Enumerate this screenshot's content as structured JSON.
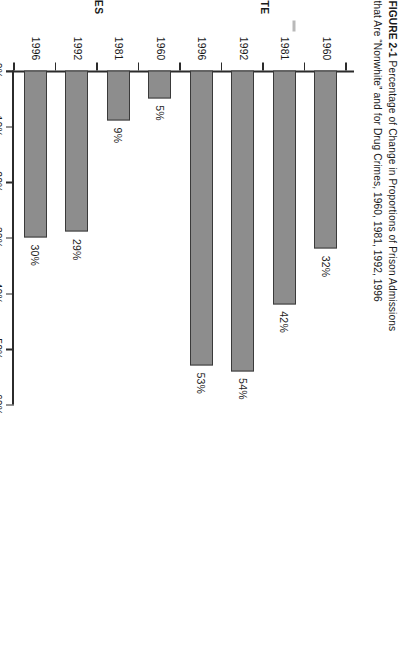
{
  "figure": {
    "number": "FIGURE 2-1",
    "caption_line1": "Percentage of Change in Proportions of Prison Admissions",
    "caption_line2": "that Are “Nonwhite” and for Drug Crimes, 1960, 1981, 1992, 1996"
  },
  "colors": {
    "bar_fill": "#8d8d8d",
    "bar_stroke": "#3a3a3a",
    "axis": "#2b2b2b",
    "text": "#1a1a1a",
    "group_dash": "#b9b9b9"
  },
  "chart_data": {
    "type": "bar",
    "title": "Percentage of Change in Proportions of Prison Admissions that Are “Nonwhite” and for Drug Crimes, 1960, 1981, 1992, 1996",
    "orientation": "horizontal-bar-rotated-page",
    "xlabel": "",
    "ylabel": "",
    "ylim": [
      0,
      60
    ],
    "yticks": [
      0,
      10,
      20,
      30,
      40,
      50,
      60
    ],
    "ytick_labels": [
      "0%",
      "10%",
      "20%",
      "30%",
      "40%",
      "50%",
      "60%"
    ],
    "grid": false,
    "legend": false,
    "groups": [
      {
        "name": "NONWHITE",
        "categories": [
          "1960",
          "1981",
          "1992",
          "1996"
        ],
        "values": [
          32,
          42,
          54,
          53
        ],
        "value_labels": [
          "32%",
          "42%",
          "54%",
          "53%"
        ]
      },
      {
        "name": "DRUG CRIMES",
        "categories": [
          "1960",
          "1981",
          "1992",
          "1996"
        ],
        "values": [
          5,
          9,
          29,
          30
        ],
        "value_labels": [
          "5%",
          "9%",
          "29%",
          "30%"
        ]
      }
    ],
    "categories": [
      "1960",
      "1981",
      "1992",
      "1996",
      "1960",
      "1981",
      "1992",
      "1996"
    ],
    "values": [
      32,
      42,
      54,
      53,
      5,
      9,
      29,
      30
    ]
  }
}
